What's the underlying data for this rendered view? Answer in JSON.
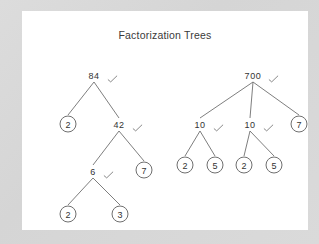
{
  "panel": {
    "title": "Factorization Trees",
    "background_color": "#ffffff",
    "page_background_color": "#d9d9d9",
    "line_color": "#6f6f6f",
    "text_color": "#333333",
    "check_color": "#7a7a7a"
  },
  "chart_data": {
    "type": "diagram",
    "title": "Factorization Trees",
    "trees": [
      {
        "id": "tree-84",
        "root": "84",
        "nodes": [
          {
            "id": "n84",
            "label": "84",
            "kind": "internal",
            "checked": true,
            "x": 72,
            "y": 65
          },
          {
            "id": "n2a",
            "label": "2",
            "kind": "leaf",
            "checked": false,
            "x": 46,
            "y": 113
          },
          {
            "id": "n42",
            "label": "42",
            "kind": "internal",
            "checked": true,
            "x": 97,
            "y": 114
          },
          {
            "id": "n6",
            "label": "6",
            "kind": "internal",
            "checked": true,
            "x": 71,
            "y": 161
          },
          {
            "id": "n7a",
            "label": "7",
            "kind": "leaf",
            "checked": false,
            "x": 122,
            "y": 159
          },
          {
            "id": "n2b",
            "label": "2",
            "kind": "leaf",
            "checked": false,
            "x": 46,
            "y": 203
          },
          {
            "id": "n3",
            "label": "3",
            "kind": "leaf",
            "checked": false,
            "x": 98,
            "y": 203
          }
        ],
        "edges": [
          [
            "n84",
            "n2a"
          ],
          [
            "n84",
            "n42"
          ],
          [
            "n42",
            "n6"
          ],
          [
            "n42",
            "n7a"
          ],
          [
            "n6",
            "n2b"
          ],
          [
            "n6",
            "n3"
          ]
        ]
      },
      {
        "id": "tree-700",
        "root": "700",
        "nodes": [
          {
            "id": "m700",
            "label": "700",
            "kind": "internal",
            "checked": true,
            "x": 231,
            "y": 65
          },
          {
            "id": "m10a",
            "label": "10",
            "kind": "internal",
            "checked": true,
            "x": 178,
            "y": 114
          },
          {
            "id": "m10b",
            "label": "10",
            "kind": "internal",
            "checked": true,
            "x": 228,
            "y": 114
          },
          {
            "id": "m7",
            "label": "7",
            "kind": "leaf",
            "checked": false,
            "x": 277,
            "y": 113
          },
          {
            "id": "m2a",
            "label": "2",
            "kind": "leaf",
            "checked": false,
            "x": 163,
            "y": 154
          },
          {
            "id": "m5a",
            "label": "5",
            "kind": "leaf",
            "checked": false,
            "x": 193,
            "y": 154
          },
          {
            "id": "m2b",
            "label": "2",
            "kind": "leaf",
            "checked": false,
            "x": 222,
            "y": 154
          },
          {
            "id": "m5b",
            "label": "5",
            "kind": "leaf",
            "checked": false,
            "x": 252,
            "y": 154
          }
        ],
        "edges": [
          [
            "m700",
            "m10a"
          ],
          [
            "m700",
            "m10b"
          ],
          [
            "m700",
            "m7"
          ],
          [
            "m10a",
            "m2a"
          ],
          [
            "m10a",
            "m5a"
          ],
          [
            "m10b",
            "m2b"
          ],
          [
            "m10b",
            "m5b"
          ]
        ]
      }
    ],
    "check_mark_glyph": "check-mark-icon"
  }
}
